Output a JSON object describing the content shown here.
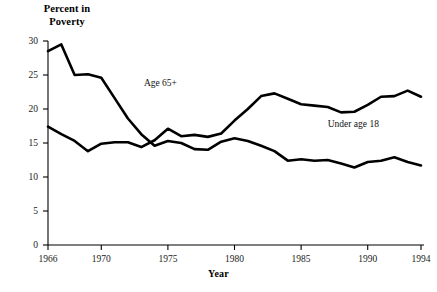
{
  "chart_data": {
    "type": "line",
    "title": "Percent in\nPoverty",
    "xlabel": "Year",
    "ylabel": "Percent in Poverty",
    "x": [
      1966,
      1967,
      1968,
      1969,
      1970,
      1971,
      1972,
      1973,
      1974,
      1975,
      1976,
      1977,
      1978,
      1979,
      1980,
      1981,
      1982,
      1983,
      1984,
      1985,
      1986,
      1987,
      1988,
      1989,
      1990,
      1991,
      1992,
      1993,
      1994
    ],
    "xlim": [
      1966,
      1994
    ],
    "ylim": [
      0,
      30
    ],
    "xticks": [
      1966,
      1970,
      1975,
      1980,
      1985,
      1990,
      1994
    ],
    "xtick_labels": [
      "1966",
      "1970",
      "1975",
      "1980",
      "1985",
      "1990",
      "1994"
    ],
    "yticks": [
      0,
      5,
      10,
      15,
      20,
      25,
      30
    ],
    "ytick_labels": [
      "0",
      "5",
      "10",
      "15",
      "20",
      "25",
      "30"
    ],
    "grid": false,
    "legend_position": "inline-annotations",
    "series": [
      {
        "name": "Age 65+",
        "color": "#000000",
        "label_x": 1973.2,
        "label_y": 23.6,
        "values": [
          28.5,
          29.5,
          25.0,
          25.1,
          24.6,
          21.6,
          18.6,
          16.3,
          14.6,
          15.3,
          15.0,
          14.1,
          14.0,
          15.2,
          15.7,
          15.3,
          14.6,
          13.8,
          12.4,
          12.6,
          12.4,
          12.5,
          12.0,
          11.4,
          12.2,
          12.4,
          12.9,
          12.2,
          11.7
        ]
      },
      {
        "name": "Under age 18",
        "color": "#000000",
        "label_x": 1987.0,
        "label_y": 17.5,
        "values": [
          17.4,
          16.3,
          15.3,
          13.8,
          14.9,
          15.1,
          15.1,
          14.4,
          15.4,
          17.1,
          16.0,
          16.2,
          15.9,
          16.4,
          18.3,
          20.0,
          21.9,
          22.3,
          21.5,
          20.7,
          20.5,
          20.3,
          19.5,
          19.6,
          20.6,
          21.8,
          21.9,
          22.7,
          21.8
        ]
      }
    ]
  },
  "series_labels": {
    "older": "Age 65+",
    "younger": "Under age 18"
  },
  "axis": {
    "y_title": "Percent in\nPoverty",
    "x_title": "Year"
  }
}
